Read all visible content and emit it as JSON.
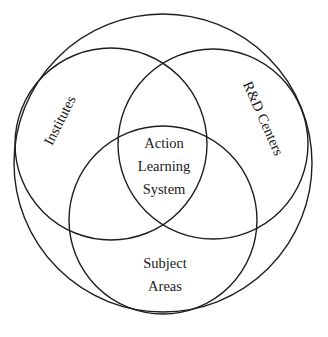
{
  "diagram": {
    "type": "venn",
    "stroke_color": "#1e1e1e",
    "background": "#ffffff",
    "circles": [
      {
        "id": "outer",
        "cx": 163,
        "cy": 163,
        "r": 149
      },
      {
        "id": "institutes",
        "cx": 111,
        "cy": 144,
        "r": 96
      },
      {
        "id": "rd-centers",
        "cx": 213,
        "cy": 144,
        "r": 95
      },
      {
        "id": "subject-areas",
        "cx": 163,
        "cy": 220,
        "r": 94
      }
    ],
    "labels": {
      "institutes": "Institutes",
      "rd_centers": "R&D Centers",
      "center": {
        "line1": "Action",
        "line2": "Learning",
        "line3": "System"
      },
      "subject_areas": {
        "line1": "Subject",
        "line2": "Areas"
      }
    }
  }
}
